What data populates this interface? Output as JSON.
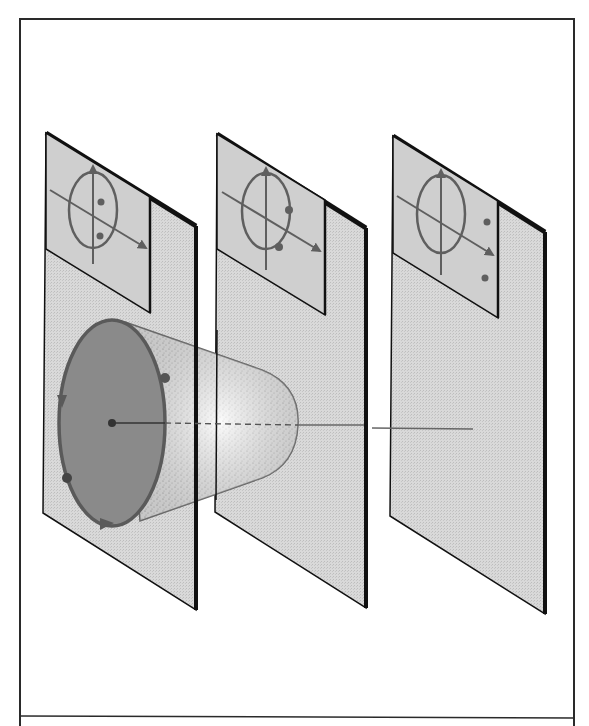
{
  "figure": {
    "description": "Three parallel planes; a circular disk on the first plane with a cone narrowing toward the second plane; a beam/axis line continues through the third plane. Each plane has an inset with a circle, crossed axes and two dots at different positions.",
    "colors": {
      "background": "#ffffff",
      "frame": "#2a2a2a",
      "plane_fill": "#dcdcdc",
      "inset_fill": "#cfcfcf",
      "plane_edge": "#111111",
      "disk_fill": "#8a8a8a",
      "disk_stroke": "#5a5a5a",
      "cone_fill": "#efefef",
      "cone_stipple": "#6e6e6e",
      "axis_line": "#555555",
      "inset_glyph": "#5f5f5f"
    },
    "planes": [
      {
        "id": "plane-1",
        "corners": [
          [
            46,
            133
          ],
          [
            196,
            226
          ],
          [
            196,
            610
          ],
          [
            43,
            513
          ]
        ],
        "inset": {
          "corners": [
            [
              46,
              133
            ],
            [
              150,
              197
            ],
            [
              150,
              313
            ],
            [
              46,
              249
            ]
          ],
          "ellipse": {
            "cx": 93,
            "cy": 208,
            "rx": 25,
            "ry": 38
          },
          "dots": [
            [
              100,
              201
            ],
            [
              100,
              235
            ]
          ]
        }
      },
      {
        "id": "plane-2",
        "corners": [
          [
            217,
            134
          ],
          [
            366,
            228
          ],
          [
            366,
            608
          ],
          [
            215,
            512
          ]
        ],
        "inset": {
          "corners": [
            [
              217,
              134
            ],
            [
              323,
              200
            ],
            [
              323,
              315
            ],
            [
              217,
              249
            ]
          ],
          "ellipse": {
            "cx": 266,
            "cy": 210,
            "rx": 24,
            "ry": 38
          },
          "dots": [
            [
              288,
              211
            ],
            [
              279,
              247
            ]
          ]
        }
      },
      {
        "id": "plane-3",
        "corners": [
          [
            393,
            136
          ],
          [
            545,
            232
          ],
          [
            545,
            614
          ],
          [
            390,
            516
          ]
        ],
        "inset": {
          "corners": [
            [
              393,
              136
            ],
            [
              498,
              201
            ],
            [
              498,
              318
            ],
            [
              393,
              253
            ]
          ],
          "ellipse": {
            "cx": 441,
            "cy": 214,
            "rx": 24,
            "ry": 39
          },
          "dots": [
            [
              487,
              222
            ],
            [
              485,
              278
            ]
          ]
        }
      }
    ],
    "disk": {
      "cx": 112,
      "cy": 423,
      "rx": 53,
      "ry": 103,
      "center_dot": [
        112,
        423
      ],
      "markers": [
        [
          165,
          378
        ],
        [
          66,
          478
        ]
      ],
      "arrows": [
        "left-side-downward",
        "bottom-rightward"
      ]
    },
    "cone": {
      "base_top": [
        125,
        322
      ],
      "base_bottom": [
        140,
        521
      ],
      "tip": [
        298,
        425
      ]
    },
    "axis_line": {
      "solid_segment": [
        [
          112,
          423
        ],
        [
          165,
          423
        ]
      ],
      "dashed_segment": [
        [
          165,
          423
        ],
        [
          298,
          425
        ]
      ],
      "continuation_1": [
        [
          298,
          425
        ],
        [
          364,
          425
        ]
      ],
      "continuation_2": [
        [
          372,
          428
        ],
        [
          473,
          429
        ]
      ]
    },
    "frame": {
      "outer": [
        [
          20,
          19
        ],
        [
          574,
          19
        ],
        [
          574,
          726
        ],
        [
          20,
          726
        ]
      ],
      "divider_y": 716
    }
  }
}
